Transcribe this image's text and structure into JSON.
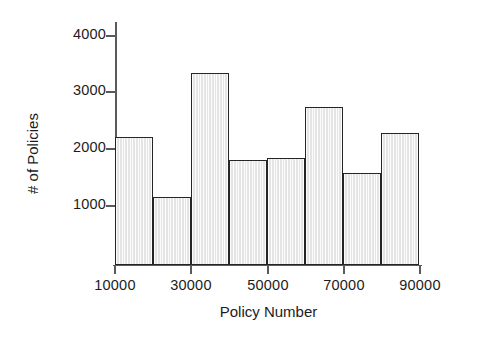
{
  "chart_data": {
    "type": "bar",
    "title": "",
    "subtitle": "",
    "xlabel": "Policy Number",
    "ylabel": "# of Policies",
    "categories": [
      "10000-20000",
      "20000-30000",
      "30000-40000",
      "40000-50000",
      "50000-60000",
      "60000-70000",
      "70000-80000",
      "80000-90000"
    ],
    "bin_edges": [
      10000,
      20000,
      30000,
      40000,
      50000,
      60000,
      70000,
      80000,
      90000
    ],
    "values": [
      2265,
      1210,
      3390,
      1860,
      1890,
      2800,
      1630,
      2330
    ],
    "xlim": [
      10000,
      90000
    ],
    "ylim": [
      0,
      4400
    ],
    "xticks": [
      10000,
      30000,
      50000,
      70000,
      90000
    ],
    "xtick_labels": [
      "10000",
      "30000",
      "50000",
      "70000",
      "90000"
    ],
    "yticks": [
      1000,
      2000,
      3000,
      4000
    ],
    "ytick_labels": [
      "1000",
      "2000",
      "3000",
      "4000"
    ],
    "grid": false,
    "legend": false,
    "legend_position": "none",
    "bar_fill_color": "#ededed",
    "bar_edge_color": "#252525",
    "axis_color": "#5a5a5a",
    "text_color": "#1c1c1c",
    "background_color": "#ffffff"
  }
}
